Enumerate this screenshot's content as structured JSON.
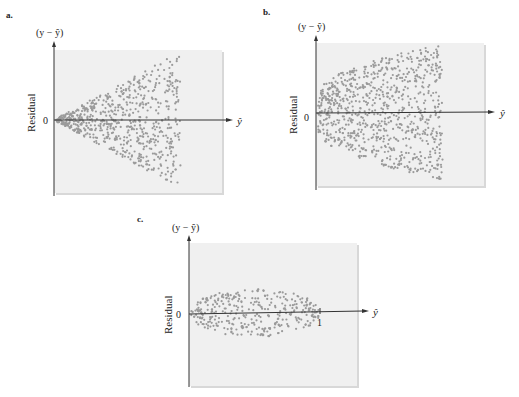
{
  "chart_data": [
    {
      "id": "a",
      "type": "scatter",
      "panel_label": "a.",
      "title": "",
      "ylabel_top": "(y − ŷ)",
      "ylabel_side": "Residual",
      "xlabel": "ŷ",
      "y_zero_label": "0",
      "x_tick_labels": [],
      "pattern": "funnel-widening",
      "description": "Residual spread increases as ŷ increases (fan / cone opening right)",
      "x_range": [
        0,
        1
      ],
      "y_range": [
        -1,
        1
      ],
      "point_count": 700,
      "envelope": {
        "x_start": 0.0,
        "x_end": 0.75,
        "half_width_start": 0.02,
        "half_width_end": 0.95
      },
      "grid": false
    },
    {
      "id": "b",
      "type": "scatter",
      "panel_label": "b.",
      "title": "",
      "ylabel_top": "(y − ŷ)",
      "ylabel_side": "Residual",
      "xlabel": "ŷ",
      "y_zero_label": "0",
      "x_tick_labels": [],
      "pattern": "curved-spread",
      "description": "Residual spread grows quickly then levels off (rounded, parabolic envelope)",
      "x_range": [
        0,
        1
      ],
      "y_range": [
        -1,
        1
      ],
      "point_count": 850,
      "envelope": {
        "x_start": 0.0,
        "x_end": 0.75,
        "half_width_start": 0.25,
        "half_width_end": 0.97
      },
      "grid": false
    },
    {
      "id": "c",
      "type": "scatter",
      "panel_label": "c.",
      "title": "",
      "ylabel_top": "(y − ŷ)",
      "ylabel_side": "Residual",
      "xlabel": "ŷ",
      "y_zero_label": "0",
      "x_tick_labels": [
        "1"
      ],
      "x_ticks": [
        1
      ],
      "pattern": "football",
      "description": "Residuals spread widest in the middle of ŷ range and narrow at ends (0 to 1)",
      "x_range": [
        0,
        1.3
      ],
      "y_range": [
        -1,
        1
      ],
      "point_count": 350,
      "envelope": {
        "x_start": 0.0,
        "x_end": 1.0,
        "half_width_max": 0.3
      },
      "grid": false
    }
  ]
}
